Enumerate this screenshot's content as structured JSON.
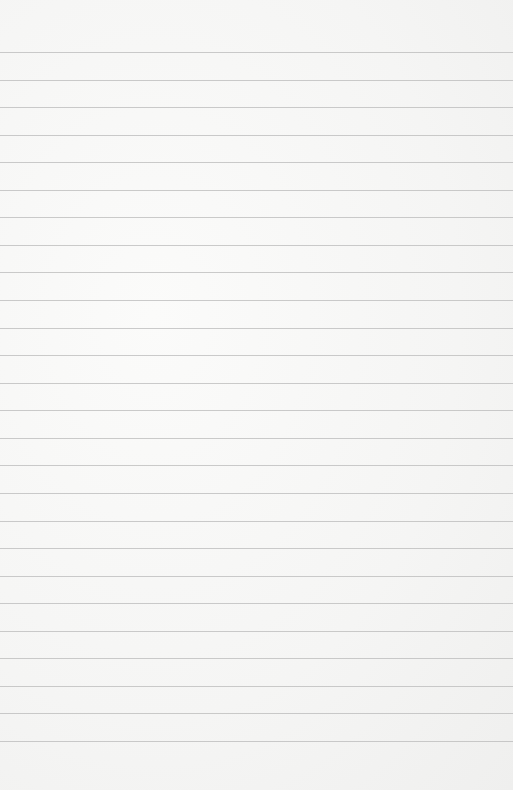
{
  "paper": {
    "type": "lined-paper",
    "background_color": "#f6f6f5",
    "line_color": "#b9b9b9",
    "first_line_y": 52,
    "line_spacing": 27.56,
    "line_count": 26
  }
}
